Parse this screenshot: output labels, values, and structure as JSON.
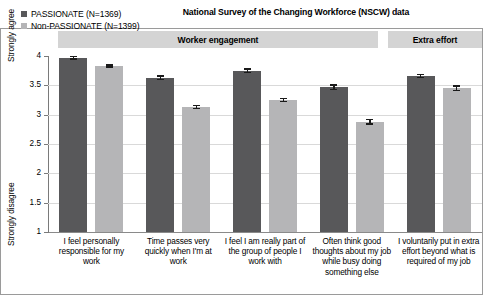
{
  "title": "National Survey of the Changing Workforce (NSCW) data",
  "legend": {
    "items": [
      {
        "label": "PASSIONATE (N=1369)",
        "color": "#58585a",
        "key": "passionate"
      },
      {
        "label": "Non-PASSIONATE (N=1399)",
        "color": "#b5b5b7",
        "key": "nonpassionate"
      }
    ]
  },
  "axis": {
    "y_top_label": "Strongly agree",
    "y_bottom_label": "Strongly disagree",
    "ticks": [
      "4",
      "3.5",
      "3",
      "2.5",
      "2",
      "1.5",
      "1"
    ]
  },
  "bands": [
    {
      "name": "Worker engagement",
      "label": "Worker engagement",
      "span": 4
    },
    {
      "name": "Extra effort",
      "label": "Extra effort",
      "span": 1
    }
  ],
  "chart_data": {
    "type": "bar",
    "title": "National Survey of the Changing Workforce (NSCW) data",
    "xlabel": "",
    "ylabel": "Strongly disagree — Strongly agree",
    "ylim": [
      1,
      4
    ],
    "yticks": [
      1,
      1.5,
      2,
      2.5,
      3,
      3.5,
      4
    ],
    "grid": true,
    "legend_position": "top-left",
    "categories": [
      "I feel personally responsible for my work",
      "Time passes very quickly when I'm at work",
      "I feel I am really part of the group of people I work with",
      "Often think good thoughts about my job while busy doing something else",
      "I voluntarily put in extra effort beyond what is required of my job"
    ],
    "groups": [
      "Worker engagement",
      "Worker engagement",
      "Worker engagement",
      "Worker engagement",
      "Extra effort"
    ],
    "series": [
      {
        "name": "PASSIONATE (N=1369)",
        "color": "#58585a",
        "values": [
          3.97,
          3.63,
          3.75,
          3.47,
          3.66
        ],
        "errors": [
          0.03,
          0.04,
          0.04,
          0.05,
          0.04
        ]
      },
      {
        "name": "Non-PASSIONATE (N=1399)",
        "color": "#b5b5b7",
        "values": [
          3.83,
          3.13,
          3.25,
          2.88,
          3.45
        ],
        "errors": [
          0.03,
          0.04,
          0.04,
          0.05,
          0.05
        ]
      }
    ]
  }
}
